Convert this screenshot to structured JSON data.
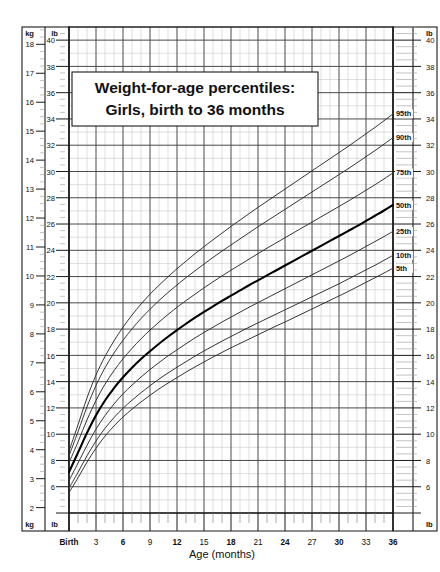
{
  "chart_data": {
    "type": "line",
    "title": "Weight-for-age percentiles:",
    "subtitle": "Girls, birth to 36 months",
    "xlabel": "Age (months)",
    "ylabel_left_primary": "kg",
    "ylabel_left_secondary": "lb",
    "ylabel_right_primary": "lb",
    "grid": true,
    "legend_position": "right-inline-labels",
    "xlim": [
      0,
      36
    ],
    "x_tick_labels": [
      "Birth",
      "3",
      "6",
      "9",
      "12",
      "15",
      "18",
      "21",
      "24",
      "27",
      "30",
      "33",
      "36"
    ],
    "x_tick_values": [
      0,
      3,
      6,
      9,
      12,
      15,
      18,
      21,
      24,
      27,
      30,
      33,
      36
    ],
    "x_minor_step_months": 1,
    "ylim_lb": [
      4,
      41
    ],
    "y_tick_values_lb": [
      4,
      6,
      8,
      10,
      12,
      14,
      16,
      18,
      20,
      22,
      24,
      26,
      28,
      30,
      32,
      34,
      36,
      38,
      40
    ],
    "y_tick_labels_lb": [
      "4",
      "6",
      "8",
      "10",
      "12",
      "14",
      "16",
      "18",
      "20",
      "22",
      "24",
      "26",
      "28",
      "30",
      "32",
      "34",
      "36",
      "38",
      "40"
    ],
    "ylim_kg": [
      1.8,
      18.6
    ],
    "y_tick_values_kg": [
      2,
      3,
      4,
      5,
      6,
      7,
      8,
      9,
      10,
      11,
      12,
      13,
      14,
      15,
      16,
      17,
      18
    ],
    "y_tick_labels_kg": [
      "2",
      "3",
      "4",
      "5",
      "6",
      "7",
      "8",
      "9",
      "10",
      "11",
      "12",
      "13",
      "14",
      "15",
      "16",
      "17",
      "18"
    ],
    "x": [
      0,
      1,
      2,
      3,
      4,
      5,
      6,
      7,
      8,
      9,
      10,
      11,
      12,
      13,
      14,
      15,
      16,
      17,
      18,
      19,
      20,
      21,
      22,
      23,
      24,
      25,
      26,
      27,
      28,
      29,
      30,
      31,
      32,
      33,
      34,
      35,
      36
    ],
    "series": [
      {
        "name": "95th",
        "label": "95th",
        "emphasis": false,
        "units": "kg",
        "values": [
          3.95,
          4.86,
          5.79,
          6.58,
          7.22,
          7.76,
          8.23,
          8.65,
          9.03,
          9.37,
          9.68,
          9.97,
          10.25,
          10.51,
          10.77,
          11.01,
          11.25,
          11.48,
          11.71,
          11.93,
          12.15,
          12.37,
          12.58,
          12.79,
          13.0,
          13.21,
          13.42,
          13.63,
          13.84,
          14.05,
          14.26,
          14.47,
          14.69,
          14.91,
          15.13,
          15.36,
          15.6
        ],
        "endpoint_lb": 34.4
      },
      {
        "name": "90th",
        "label": "90th",
        "emphasis": false,
        "units": "kg",
        "values": [
          3.79,
          4.62,
          5.48,
          6.22,
          6.83,
          7.34,
          7.78,
          8.17,
          8.53,
          8.85,
          9.15,
          9.43,
          9.69,
          9.94,
          10.18,
          10.41,
          10.64,
          10.86,
          11.07,
          11.28,
          11.49,
          11.7,
          11.9,
          12.1,
          12.3,
          12.5,
          12.7,
          12.9,
          13.1,
          13.3,
          13.5,
          13.7,
          13.91,
          14.12,
          14.33,
          14.55,
          14.78
        ],
        "endpoint_lb": 32.6
      },
      {
        "name": "75th",
        "label": "75th",
        "emphasis": false,
        "units": "kg",
        "values": [
          3.55,
          4.27,
          5.03,
          5.7,
          6.26,
          6.73,
          7.14,
          7.5,
          7.83,
          8.13,
          8.41,
          8.67,
          8.92,
          9.15,
          9.37,
          9.59,
          9.8,
          10.0,
          10.2,
          10.39,
          10.58,
          10.77,
          10.96,
          11.14,
          11.32,
          11.5,
          11.68,
          11.86,
          12.04,
          12.22,
          12.4,
          12.58,
          12.77,
          12.96,
          13.15,
          13.35,
          13.56
        ],
        "endpoint_lb": 29.9
      },
      {
        "name": "50th",
        "label": "50th",
        "emphasis": true,
        "units": "kg",
        "values": [
          3.23,
          3.9,
          4.58,
          5.19,
          5.7,
          6.13,
          6.5,
          6.83,
          7.13,
          7.4,
          7.66,
          7.9,
          8.13,
          8.35,
          8.56,
          8.76,
          8.95,
          9.14,
          9.32,
          9.5,
          9.68,
          9.85,
          10.02,
          10.19,
          10.36,
          10.53,
          10.7,
          10.87,
          11.04,
          11.21,
          11.38,
          11.55,
          11.72,
          11.9,
          12.08,
          12.26,
          12.45
        ],
        "endpoint_lb": 27.4
      },
      {
        "name": "25th",
        "label": "25th",
        "emphasis": false,
        "units": "kg",
        "values": [
          2.93,
          3.54,
          4.15,
          4.71,
          5.18,
          5.58,
          5.93,
          6.23,
          6.51,
          6.77,
          7.01,
          7.24,
          7.45,
          7.66,
          7.86,
          8.05,
          8.23,
          8.41,
          8.58,
          8.75,
          8.92,
          9.08,
          9.24,
          9.4,
          9.56,
          9.72,
          9.88,
          10.04,
          10.2,
          10.36,
          10.52,
          10.68,
          10.85,
          11.02,
          11.19,
          11.36,
          11.54
        ],
        "endpoint_lb": 25.4
      },
      {
        "name": "10th",
        "label": "10th",
        "emphasis": false,
        "units": "kg",
        "values": [
          2.67,
          3.22,
          3.79,
          4.3,
          4.74,
          5.11,
          5.43,
          5.71,
          5.97,
          6.21,
          6.44,
          6.65,
          6.85,
          7.04,
          7.23,
          7.41,
          7.58,
          7.75,
          7.91,
          8.07,
          8.23,
          8.38,
          8.53,
          8.68,
          8.83,
          8.98,
          9.13,
          9.28,
          9.43,
          9.58,
          9.73,
          9.89,
          10.05,
          10.21,
          10.37,
          10.54,
          10.71
        ],
        "endpoint_lb": 23.6
      },
      {
        "name": "5th",
        "label": "5th",
        "emphasis": false,
        "units": "kg",
        "values": [
          2.52,
          3.03,
          3.57,
          4.05,
          4.47,
          4.82,
          5.13,
          5.4,
          5.65,
          5.88,
          6.1,
          6.3,
          6.49,
          6.68,
          6.86,
          7.03,
          7.2,
          7.36,
          7.52,
          7.67,
          7.82,
          7.97,
          8.12,
          8.27,
          8.41,
          8.56,
          8.71,
          8.86,
          9.01,
          9.16,
          9.31,
          9.46,
          9.62,
          9.78,
          9.94,
          10.1,
          10.27
        ],
        "endpoint_lb": 22.6
      }
    ]
  },
  "axes": {
    "left_top_unit_kg": "kg",
    "left_top_unit_lb": "lb",
    "left_bottom_unit_kg": "kg",
    "left_bottom_unit_lb": "lb",
    "right_top_unit_lb": "lb",
    "right_bottom_unit_lb": "lb"
  },
  "colors": {
    "background": "#ffffff",
    "frame": "#1a1a1a",
    "major_grid": "#4a4a4a",
    "minor_grid": "#c9c9c9",
    "curve": "#2b2b2b",
    "curve_emphasis": "#000000",
    "text": "#111111"
  }
}
